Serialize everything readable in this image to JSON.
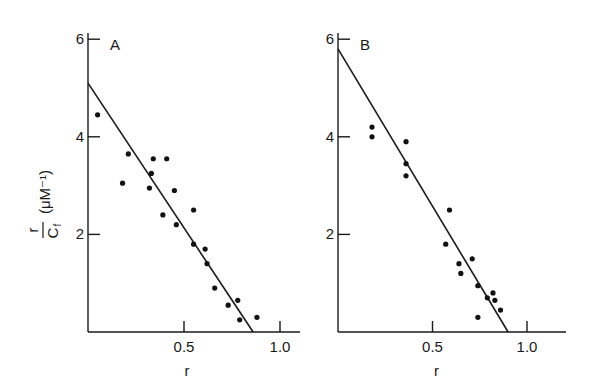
{
  "chart_data": [
    {
      "type": "scatter",
      "panel_label": "A",
      "xlabel": "r",
      "ylabel": "r/Cf (μM⁻¹)",
      "xlim": [
        0,
        1.1
      ],
      "ylim": [
        0,
        6
      ],
      "x_ticks": [
        0.5,
        1.0
      ],
      "x_tick_labels": [
        "0.5",
        "1.0"
      ],
      "y_ticks": [
        2,
        4,
        6
      ],
      "y_tick_labels": [
        "2",
        "4",
        "6"
      ],
      "grid": false,
      "fit_line": {
        "intercept_y": 5.1,
        "intercept_x": 0.86
      },
      "points": [
        [
          0.05,
          4.45
        ],
        [
          0.18,
          3.05
        ],
        [
          0.21,
          3.65
        ],
        [
          0.32,
          2.95
        ],
        [
          0.33,
          3.25
        ],
        [
          0.34,
          3.55
        ],
        [
          0.39,
          2.4
        ],
        [
          0.41,
          3.55
        ],
        [
          0.46,
          2.2
        ],
        [
          0.45,
          2.9
        ],
        [
          0.55,
          2.5
        ],
        [
          0.55,
          1.8
        ],
        [
          0.61,
          1.7
        ],
        [
          0.62,
          1.4
        ],
        [
          0.66,
          0.9
        ],
        [
          0.73,
          0.55
        ],
        [
          0.78,
          0.65
        ],
        [
          0.79,
          0.25
        ],
        [
          0.88,
          0.3
        ]
      ]
    },
    {
      "type": "scatter",
      "panel_label": "B",
      "xlabel": "r",
      "ylabel": "",
      "xlim": [
        0,
        1.2
      ],
      "ylim": [
        0,
        6
      ],
      "x_ticks": [
        0.5,
        1.0
      ],
      "x_tick_labels": [
        "0.5",
        "1.0"
      ],
      "y_ticks": [
        2,
        4,
        6
      ],
      "y_tick_labels": [
        "2",
        "4",
        "6"
      ],
      "grid": false,
      "fit_line": {
        "intercept_y": 5.8,
        "intercept_x": 0.9
      },
      "points": [
        [
          0.18,
          4.2
        ],
        [
          0.18,
          4.0
        ],
        [
          0.36,
          3.9
        ],
        [
          0.36,
          3.45
        ],
        [
          0.36,
          3.2
        ],
        [
          0.59,
          2.5
        ],
        [
          0.57,
          1.8
        ],
        [
          0.64,
          1.4
        ],
        [
          0.65,
          1.2
        ],
        [
          0.71,
          1.5
        ],
        [
          0.74,
          0.95
        ],
        [
          0.74,
          0.3
        ],
        [
          0.79,
          0.7
        ],
        [
          0.82,
          0.8
        ],
        [
          0.83,
          0.65
        ],
        [
          0.86,
          0.45
        ]
      ]
    }
  ],
  "panels": {
    "a": {
      "label": "A",
      "xlabel": "r"
    },
    "b": {
      "label": "B",
      "xlabel": "r"
    },
    "ylabel_numerator": "r",
    "ylabel_denominator": "C",
    "ylabel_subscript": "f",
    "ylabel_units": "(μM⁻¹)"
  }
}
